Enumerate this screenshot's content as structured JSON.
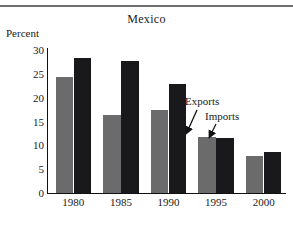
{
  "chart_data": {
    "type": "bar",
    "title": "Mexico",
    "xlabel": "",
    "ylabel": "Percent",
    "categories": [
      "1980",
      "1985",
      "1990",
      "1995",
      "2000"
    ],
    "series": [
      {
        "name": "Exports",
        "color": "#6b6b6b",
        "values": [
          24.3,
          16.4,
          17.5,
          11.8,
          7.7
        ]
      },
      {
        "name": "Imports",
        "color": "#19191c",
        "values": [
          28.3,
          27.6,
          22.8,
          11.6,
          8.5
        ]
      }
    ],
    "ylim": [
      0,
      30
    ],
    "yticks": [
      "0",
      "5",
      "10",
      "15",
      "20",
      "25",
      "30"
    ],
    "ytick_values": [
      0,
      5,
      10,
      15,
      20,
      25,
      30
    ],
    "grid": false,
    "legend": "annotations",
    "annotations": [
      {
        "text": "Exports",
        "target_series": "Exports",
        "target_category": "1995"
      },
      {
        "text": "Imports",
        "target_series": "Imports",
        "target_category": "1995"
      }
    ]
  },
  "axis": {
    "y_title": "Percent"
  },
  "icons": {
    "arrow_exports": "arrow-down-left-icon",
    "arrow_imports": "arrow-down-left-icon"
  }
}
